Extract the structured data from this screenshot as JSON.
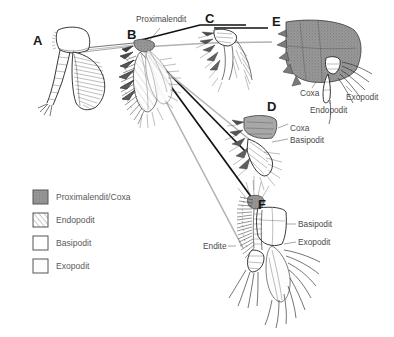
{
  "figure": {
    "background_color": "#ffffff",
    "width": 394,
    "height": 337
  },
  "panels": [
    {
      "id": "A",
      "letter": "A",
      "x": 33,
      "y": 45
    },
    {
      "id": "B",
      "letter": "B",
      "x": 127,
      "y": 39
    },
    {
      "id": "C",
      "letter": "C",
      "x": 205,
      "y": 23
    },
    {
      "id": "D",
      "letter": "D",
      "x": 267,
      "y": 111
    },
    {
      "id": "E",
      "letter": "E",
      "x": 272,
      "y": 26
    },
    {
      "id": "F",
      "letter": "F",
      "x": 258,
      "y": 209
    }
  ],
  "annotations": {
    "proximal_endite_top": "Proximalendit",
    "panel_e_coxa": "Coxa",
    "panel_e_endopodit": "Endopodit",
    "panel_e_exopodit": "Exopodit",
    "panel_d_coxa": "Coxa",
    "panel_d_basipodit": "Basipodit",
    "panel_f_basipodit": "Basipodit",
    "panel_f_exopodit": "Exopodit",
    "panel_f_endite": "Endite"
  },
  "legend": {
    "items": [
      {
        "label": "Proximalendit/Coxa",
        "swatch": "stipple-dark",
        "color": "#8f8f8f"
      },
      {
        "label": "Endopodit",
        "swatch": "hatch-diagonal",
        "color": "#ffffff"
      },
      {
        "label": "Basipodit",
        "swatch": "plain-white",
        "color": "#ffffff"
      },
      {
        "label": "Exopodit",
        "swatch": "plain-white",
        "color": "#fdfdfd"
      }
    ]
  },
  "colors": {
    "ink": "#2a2a2a",
    "label_text": "#4a4a4a",
    "legend_text": "#5a5a5a",
    "leader_black": "#111111",
    "leader_gray": "#b2b2b2",
    "coxa_fill": "#8f8f8f"
  }
}
